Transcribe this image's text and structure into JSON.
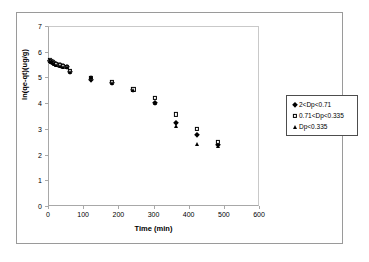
{
  "chart_data": {
    "type": "scatter",
    "title": "",
    "xlabel": "Time (min)",
    "ylabel": "ln(qe-qt)(ug/g)",
    "xlim": [
      0,
      600
    ],
    "ylim": [
      0,
      7
    ],
    "xticks": [
      0,
      100,
      200,
      300,
      400,
      500,
      600
    ],
    "yticks": [
      0,
      1,
      2,
      3,
      4,
      5,
      6,
      7
    ],
    "grid": false,
    "legend_position": "right-outside",
    "series": [
      {
        "name": "2<Dp<0.71",
        "marker": "filled-diamond",
        "color": "#000000",
        "points": [
          [
            2,
            5.68
          ],
          [
            4,
            5.66
          ],
          [
            6,
            5.64
          ],
          [
            8,
            5.63
          ],
          [
            10,
            5.62
          ],
          [
            13,
            5.6
          ],
          [
            16,
            5.58
          ],
          [
            20,
            5.56
          ],
          [
            25,
            5.54
          ],
          [
            30,
            5.52
          ],
          [
            35,
            5.5
          ],
          [
            40,
            5.48
          ],
          [
            50,
            5.44
          ],
          [
            60,
            5.26
          ],
          [
            120,
            4.94
          ],
          [
            180,
            4.83
          ],
          [
            240,
            4.55
          ],
          [
            300,
            4.06
          ],
          [
            360,
            3.25
          ],
          [
            420,
            2.8
          ],
          [
            480,
            2.42
          ]
        ]
      },
      {
        "name": "0.71<Dp<0.335",
        "marker": "open-square",
        "color": "#000000",
        "points": [
          [
            2,
            5.7
          ],
          [
            5,
            5.67
          ],
          [
            10,
            5.63
          ],
          [
            15,
            5.6
          ],
          [
            20,
            5.57
          ],
          [
            30,
            5.53
          ],
          [
            40,
            5.49
          ],
          [
            50,
            5.45
          ],
          [
            60,
            5.28
          ],
          [
            120,
            5.02
          ],
          [
            180,
            4.85
          ],
          [
            240,
            4.57
          ],
          [
            300,
            4.25
          ],
          [
            360,
            3.6
          ],
          [
            420,
            3.05
          ],
          [
            480,
            2.52
          ]
        ]
      },
      {
        "name": "Dp<0.335",
        "marker": "filled-triangle",
        "color": "#000000",
        "points": [
          [
            2,
            5.66
          ],
          [
            5,
            5.63
          ],
          [
            10,
            5.6
          ],
          [
            15,
            5.57
          ],
          [
            20,
            5.54
          ],
          [
            30,
            5.5
          ],
          [
            40,
            5.46
          ],
          [
            50,
            5.43
          ],
          [
            60,
            5.24
          ],
          [
            120,
            5.05
          ],
          [
            180,
            4.82
          ],
          [
            240,
            4.54
          ],
          [
            300,
            4.04
          ],
          [
            360,
            3.15
          ],
          [
            420,
            2.44
          ],
          [
            480,
            2.36
          ]
        ]
      }
    ]
  },
  "legend": {
    "items": [
      {
        "label": "2<Dp<0.71",
        "marker": "filled-diamond"
      },
      {
        "label": "0.71<Dp<0.335",
        "marker": "open-square"
      },
      {
        "label": "Dp<0.335",
        "marker": "filled-triangle"
      }
    ]
  }
}
